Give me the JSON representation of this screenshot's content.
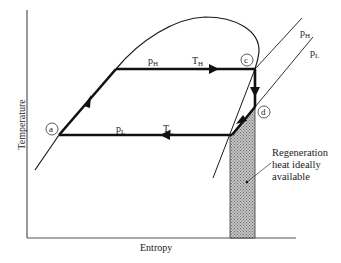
{
  "diagram": {
    "type": "T-s diagram (vapor power cycle with regeneration)",
    "axes": {
      "x_label": "Entropy",
      "y_label": "Temperature"
    },
    "states": [
      {
        "id": "a",
        "label": "a"
      },
      {
        "id": "c",
        "label": "c"
      },
      {
        "id": "d",
        "label": "d"
      }
    ],
    "process_labels": {
      "high": {
        "p": "p",
        "p_sub": "H",
        "T": "T",
        "T_sub": "H"
      },
      "low": {
        "p": "p",
        "p_sub": "L",
        "T": "T",
        "T_sub": "L"
      }
    },
    "isobars": [
      {
        "p": "p",
        "sub": "H"
      },
      {
        "p": "p",
        "sub": "L"
      }
    ],
    "annotation": {
      "lines": [
        "Regeneration",
        "heat ideally",
        "available"
      ]
    },
    "colors": {
      "line": "#1a1a1a",
      "hatch": "#9a9a9a",
      "background": "#ffffff"
    }
  }
}
